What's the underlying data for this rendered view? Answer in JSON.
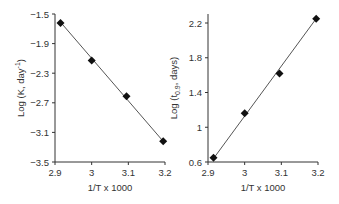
{
  "chart_data": [
    {
      "type": "scatter",
      "title": "",
      "xlabel": "1/T  x 1000",
      "ylabel": "Log (K, day⁻¹)",
      "xlim": [
        2.9,
        3.2
      ],
      "ylim": [
        -3.5,
        -1.5
      ],
      "xticks": [
        "2.9",
        "3",
        "3.1",
        "3.2"
      ],
      "yticks": [
        "-1.5",
        "-1.9",
        "-2.3",
        "-2.7",
        "-3.1",
        "-3.5"
      ],
      "grid": false,
      "legend": null,
      "series": [
        {
          "name": "Log K",
          "marker": "diamond",
          "x": [
            2.915,
            3.0,
            3.095,
            3.195
          ],
          "y": [
            -1.62,
            -2.13,
            -2.61,
            -3.22
          ]
        }
      ],
      "trendline": {
        "x": [
          2.915,
          3.195
        ],
        "y": [
          -1.61,
          -3.22
        ]
      }
    },
    {
      "type": "scatter",
      "title": "",
      "xlabel": "1/T  x 1000",
      "ylabel": "Log (t0.9, days)",
      "xlim": [
        2.9,
        3.2
      ],
      "ylim": [
        0.6,
        2.2
      ],
      "xticks": [
        "2.9",
        "3",
        "3.1",
        "3.2"
      ],
      "yticks": [
        "0.6",
        "1",
        "1.4",
        "1.8",
        "2.2"
      ],
      "grid": false,
      "legend": null,
      "series": [
        {
          "name": "Log t0.9",
          "marker": "diamond",
          "x": [
            2.915,
            3.0,
            3.095,
            3.195
          ],
          "y": [
            0.65,
            1.16,
            1.62,
            2.25
          ]
        }
      ],
      "trendline": {
        "x": [
          2.915,
          3.195
        ],
        "y": [
          0.64,
          2.25
        ]
      }
    }
  ],
  "left": {
    "ylabel_main": "Log (K, day",
    "ylabel_sup": "-1",
    "ylabel_end": ")",
    "xlabel": "1/T  x 1000",
    "xticks": [
      "2.9",
      "3",
      "3.1",
      "3.2"
    ],
    "yticks": [
      "−1.5",
      "−1.9",
      "−2.3",
      "−2.7",
      "−3.1",
      "−3.5"
    ]
  },
  "right": {
    "ylabel_main": "Log (t",
    "ylabel_sub": "0.9",
    "ylabel_end": ", days)",
    "xlabel": "1/T  x 1000",
    "xticks": [
      "2.9",
      "3",
      "3.1",
      "3.2"
    ],
    "yticks": [
      "0.6",
      "1",
      "1.4",
      "1.8",
      "2.2"
    ]
  },
  "colors": {
    "axis": "#333333",
    "line": "#555555",
    "marker": "#111111"
  }
}
